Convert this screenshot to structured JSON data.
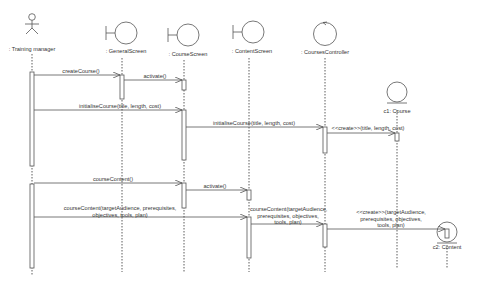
{
  "diagram": {
    "type": "uml-sequence",
    "participants": [
      {
        "id": "tm",
        "label": ": Training manager",
        "kind": "actor"
      },
      {
        "id": "gs",
        "label": ": GeneralScreen",
        "kind": "boundary"
      },
      {
        "id": "cs",
        "label": ": CourseScreen",
        "kind": "boundary"
      },
      {
        "id": "ct",
        "label": ": ContentScreen",
        "kind": "boundary"
      },
      {
        "id": "cc",
        "label": ": CoursesController",
        "kind": "control"
      },
      {
        "id": "c1",
        "label": "c1: Course",
        "kind": "entity"
      },
      {
        "id": "c2",
        "label": "c2: Content",
        "kind": "entity"
      }
    ],
    "messages": [
      {
        "from": "tm",
        "to": "gs",
        "label": "createCourse()"
      },
      {
        "from": "gs",
        "to": "cs",
        "label": "activate()"
      },
      {
        "from": "tm",
        "to": "cs",
        "label": "initialiseCourse(title, length, cost)"
      },
      {
        "from": "cs",
        "to": "cc",
        "label": "initialiseCourse(title, length, cost)"
      },
      {
        "from": "cc",
        "to": "c1",
        "label": "<<create>>(title, length, cost)"
      },
      {
        "from": "tm",
        "to": "cs",
        "label": "courseContent()"
      },
      {
        "from": "cs",
        "to": "ct",
        "label": "activate()"
      },
      {
        "from": "tm",
        "to": "ct",
        "label": "courseContent(targetAudience, prerequisites, objectives, tools, plan)",
        "lines": [
          "courseContent(targetAudience, prerequisites,",
          "objectives, tools, plan)"
        ]
      },
      {
        "from": "ct",
        "to": "cc",
        "label": "courseContent(targetAudience, prerequisites, objectives, tools, plan)",
        "lines": [
          "courseContent(targetAudience,",
          "prerequisites, objectives,",
          "tools, plan)"
        ]
      },
      {
        "from": "cc",
        "to": "c2",
        "label": "<<create>>(targetAudience, prerequisites, objectives, tools, plan)",
        "lines": [
          "<<create>>(targetAudience,",
          "prerequisites, objectives,",
          "tools, plan)"
        ]
      }
    ]
  }
}
